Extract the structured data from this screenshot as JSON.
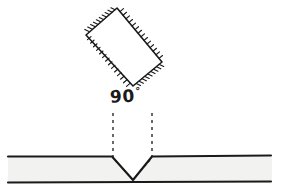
{
  "figure": {
    "background_color": "#ffffff",
    "ink_color": "#1a1a1a",
    "plate_fill_color": "#f2f2f0",
    "width": 281,
    "height": 191
  },
  "annotations": {
    "angle_value": "90",
    "degree_symbol": "°"
  },
  "tool": {
    "name": "hatched-rectangular-tool",
    "corners": [
      [
        117,
        8
      ],
      [
        162,
        62
      ],
      [
        133,
        86
      ],
      [
        86,
        35
      ]
    ],
    "hatch_side": "outward",
    "hatch_count": 58,
    "hatch_length": 5
  },
  "workpiece": {
    "name": "plate",
    "top_surface_y": 157,
    "bottom_surface_y": 182,
    "left_x": 8,
    "right_x": 272,
    "notch": {
      "left_shoulder_x": 113,
      "right_shoulder_x": 152,
      "apex_x": 133,
      "apex_y": 180,
      "included_angle": "90"
    }
  },
  "guides": {
    "dashed_lines": [
      {
        "name": "left-guide",
        "x": 113,
        "y_top": 113,
        "y_bottom": 158
      },
      {
        "name": "right-guide",
        "x": 152,
        "y_top": 113,
        "y_bottom": 158
      }
    ],
    "dash_pattern": "3,4"
  }
}
